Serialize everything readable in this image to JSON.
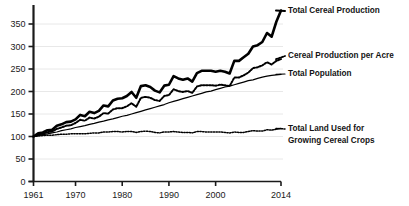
{
  "chart_data": {
    "type": "line",
    "title": "",
    "xlabel": "",
    "ylabel": "",
    "xlim": [
      1961,
      2014
    ],
    "ylim": [
      0,
      390
    ],
    "grid": true,
    "grid_axis": "y",
    "legend_position": "right-inline",
    "index_note": "All series indexed to 100 in 1961",
    "yticks": [
      0,
      50,
      100,
      150,
      200,
      250,
      300,
      350
    ],
    "ytick_labels": [
      "0",
      "50",
      "100",
      "150",
      "200",
      "250",
      "300",
      "350"
    ],
    "xticks": [
      1961,
      1970,
      1980,
      1990,
      2000,
      2014
    ],
    "xtick_labels": [
      "1961",
      "1970",
      "1980",
      "1990",
      "2000",
      "2014"
    ],
    "x": [
      1961,
      1962,
      1963,
      1964,
      1965,
      1966,
      1967,
      1968,
      1969,
      1970,
      1971,
      1972,
      1973,
      1974,
      1975,
      1976,
      1977,
      1978,
      1979,
      1980,
      1981,
      1982,
      1983,
      1984,
      1985,
      1986,
      1987,
      1988,
      1989,
      1990,
      1991,
      1992,
      1993,
      1994,
      1995,
      1996,
      1997,
      1998,
      1999,
      2000,
      2001,
      2002,
      2003,
      2004,
      2005,
      2006,
      2007,
      2008,
      2009,
      2010,
      2011,
      2012,
      2013,
      2014
    ],
    "series": [
      {
        "name": "Total Cereal Production",
        "style": "solid-thick",
        "color": "#000000",
        "values": [
          100,
          107,
          109,
          114,
          115,
          124,
          127,
          132,
          133,
          138,
          148,
          145,
          155,
          152,
          157,
          169,
          167,
          180,
          184,
          185,
          190,
          199,
          186,
          212,
          214,
          210,
          202,
          198,
          213,
          215,
          234,
          229,
          226,
          229,
          222,
          241,
          246,
          246,
          246,
          244,
          246,
          244,
          240,
          268,
          268,
          276,
          284,
          300,
          303,
          310,
          330,
          322,
          355,
          380
        ]
      },
      {
        "name": "Cereal Production per Acre",
        "style": "dotted-medium",
        "color": "#000000",
        "values": [
          100,
          104,
          106,
          110,
          111,
          117,
          120,
          124,
          125,
          130,
          137,
          135,
          142,
          140,
          144,
          152,
          151,
          160,
          163,
          163,
          167,
          174,
          166,
          186,
          188,
          186,
          181,
          179,
          190,
          192,
          205,
          201,
          199,
          201,
          197,
          211,
          214,
          214,
          214,
          213,
          215,
          214,
          212,
          231,
          231,
          236,
          242,
          252,
          254,
          258,
          265,
          260,
          268,
          272
        ]
      },
      {
        "name": "Total Population",
        "style": "solid-thin",
        "color": "#000000",
        "values": [
          100,
          102,
          104,
          106,
          108,
          110,
          113,
          115,
          117,
          120,
          122,
          124,
          127,
          129,
          132,
          134,
          137,
          139,
          142,
          145,
          147,
          150,
          153,
          156,
          159,
          162,
          165,
          168,
          171,
          175,
          178,
          181,
          184,
          187,
          190,
          193,
          196,
          199,
          201,
          204,
          207,
          210,
          212,
          215,
          218,
          221,
          224,
          226,
          229,
          232,
          234,
          236,
          237,
          238
        ]
      },
      {
        "name": "Total Land Used for Growing Cereal Crops",
        "style": "dotted-fine",
        "color": "#000000",
        "values": [
          100,
          101,
          102,
          103,
          103,
          104,
          105,
          105,
          106,
          106,
          106,
          106,
          107,
          108,
          108,
          110,
          110,
          111,
          111,
          110,
          111,
          111,
          109,
          111,
          112,
          111,
          109,
          108,
          110,
          110,
          111,
          110,
          109,
          109,
          108,
          111,
          111,
          110,
          110,
          110,
          110,
          109,
          108,
          110,
          109,
          109,
          111,
          113,
          112,
          112,
          115,
          114,
          116,
          118
        ]
      }
    ]
  },
  "legend": {
    "items": [
      {
        "label": "Total Cereal Production",
        "lines": [
          "Total Cereal Production"
        ]
      },
      {
        "label": "Cereal Production per Acre",
        "lines": [
          "Cereal Production per Acre"
        ]
      },
      {
        "label": "Total Population",
        "lines": [
          "Total Population"
        ]
      },
      {
        "label": "Total Land Used for Growing Cereal Crops",
        "lines": [
          "Total Land Used for",
          "Growing Cereal Crops"
        ]
      }
    ]
  },
  "colors": {
    "axis": "#1a1a1a",
    "grid": "#e8e8e8",
    "text": "#141414",
    "background": "#ffffff"
  }
}
